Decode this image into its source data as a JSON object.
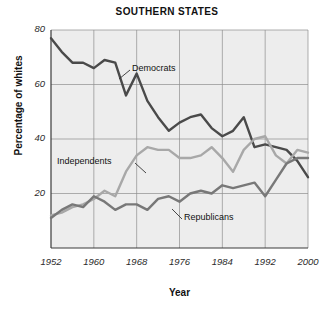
{
  "chart_data": {
    "type": "line",
    "title": "SOUTHERN STATES",
    "xlabel": "Year",
    "ylabel": "Percentage of whites",
    "grid": true,
    "legend_position": "inline-annotations",
    "xlim": [
      1952,
      2000
    ],
    "ylim": [
      0,
      80
    ],
    "xticks": [
      1952,
      1960,
      1968,
      1976,
      1984,
      1992,
      2000
    ],
    "xticklabels": [
      "1952",
      "1960",
      "1968",
      "1976",
      "1984",
      "1992",
      "2000"
    ],
    "yticks": [
      20,
      40,
      60,
      80
    ],
    "yticklabels": [
      "20",
      "40",
      "60",
      "80"
    ],
    "x": [
      1952,
      1954,
      1956,
      1958,
      1960,
      1962,
      1964,
      1966,
      1968,
      1970,
      1972,
      1974,
      1976,
      1978,
      1980,
      1982,
      1984,
      1986,
      1988,
      1990,
      1992,
      1994,
      1996,
      1998,
      2000
    ],
    "series": [
      {
        "name": "Democrats",
        "color": "#4a4a4a",
        "values": [
          77,
          72,
          68,
          68,
          66,
          69,
          68,
          56,
          64,
          54,
          48,
          43,
          46,
          48,
          49,
          44,
          41,
          43,
          48,
          37,
          38,
          37,
          36,
          32,
          26
        ]
      },
      {
        "name": "Independents",
        "color": "#a8a8a8",
        "values": [
          12,
          13,
          15,
          16,
          18,
          21,
          19,
          28,
          34,
          37,
          36,
          36,
          33,
          33,
          34,
          37,
          33,
          28,
          36,
          40,
          41,
          34,
          31,
          36,
          35
        ]
      },
      {
        "name": "Republicans",
        "color": "#787878",
        "values": [
          11,
          14,
          16,
          15,
          19,
          17,
          14,
          16,
          16,
          14,
          18,
          19,
          17,
          20,
          21,
          20,
          23,
          22,
          23,
          24,
          19,
          25,
          31,
          33,
          33
        ]
      }
    ],
    "annotations": [
      {
        "label": "Democrats",
        "series": "Democrats"
      },
      {
        "label": "Independents",
        "series": "Independents"
      },
      {
        "label": "Republicans",
        "series": "Republicans"
      }
    ]
  }
}
